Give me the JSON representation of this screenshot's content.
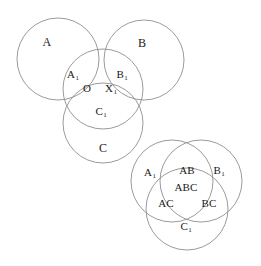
{
  "figure": {
    "background_color": "#ffffff",
    "stroke_color": "#8e8e8e",
    "text_color": "#1a1a1a",
    "width": 261,
    "height": 266
  },
  "left_diagram": {
    "name": "three-overlapping-circles-with-center-region",
    "circles": [
      {
        "id": "A",
        "cx": 58,
        "cy": 59,
        "r": 41
      },
      {
        "id": "B",
        "cx": 144,
        "cy": 60,
        "r": 40
      },
      {
        "id": "middle",
        "cx": 103,
        "cy": 89,
        "r": 40
      },
      {
        "id": "C",
        "cx": 103,
        "cy": 123,
        "r": 40
      }
    ],
    "labels": [
      {
        "id": "label-A",
        "text": "A",
        "sub": "",
        "x": 47,
        "y": 42,
        "size": "big"
      },
      {
        "id": "label-B",
        "text": "B",
        "sub": "",
        "x": 142,
        "y": 43,
        "size": "big"
      },
      {
        "id": "label-A1",
        "text": "A",
        "sub": "1",
        "x": 73,
        "y": 74,
        "size": "normal"
      },
      {
        "id": "label-B1",
        "text": "B",
        "sub": "1",
        "x": 122,
        "y": 74,
        "size": "normal"
      },
      {
        "id": "label-O",
        "text": "O",
        "sub": "",
        "x": 87,
        "y": 88,
        "size": "normal"
      },
      {
        "id": "label-X1",
        "text": "X",
        "sub": "1",
        "x": 111,
        "y": 88,
        "size": "normal"
      },
      {
        "id": "label-C1",
        "text": "C",
        "sub": "1",
        "x": 101,
        "y": 111,
        "size": "normal"
      },
      {
        "id": "label-C",
        "text": "C",
        "sub": "",
        "x": 103,
        "y": 148,
        "size": "big"
      }
    ]
  },
  "right_diagram": {
    "name": "classic-three-circle-venn",
    "circles": [
      {
        "id": "A1",
        "cx": 172,
        "cy": 181,
        "r": 41
      },
      {
        "id": "B1",
        "cx": 201,
        "cy": 181,
        "r": 41
      },
      {
        "id": "C1",
        "cx": 187,
        "cy": 209,
        "r": 41
      }
    ],
    "labels": [
      {
        "id": "label-A1",
        "text": "A",
        "sub": "1",
        "x": 150,
        "y": 172,
        "size": "normal"
      },
      {
        "id": "label-AB",
        "text": "AB",
        "sub": "",
        "x": 187,
        "y": 170,
        "size": "normal"
      },
      {
        "id": "label-B1",
        "text": "B",
        "sub": "1",
        "x": 219,
        "y": 170,
        "size": "normal"
      },
      {
        "id": "label-ABC",
        "text": "ABC",
        "sub": "",
        "x": 186,
        "y": 187,
        "size": "normal"
      },
      {
        "id": "label-AC",
        "text": "AC",
        "sub": "",
        "x": 166,
        "y": 203,
        "size": "normal"
      },
      {
        "id": "label-BC",
        "text": "BC",
        "sub": "",
        "x": 209,
        "y": 203,
        "size": "normal"
      },
      {
        "id": "label-C1",
        "text": "C",
        "sub": "1",
        "x": 186,
        "y": 226,
        "size": "normal"
      }
    ]
  }
}
